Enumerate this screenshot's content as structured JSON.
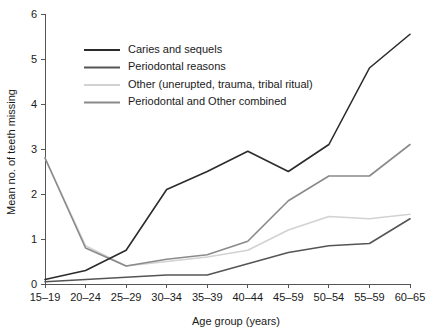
{
  "chart_data": {
    "type": "line",
    "title": "",
    "xlabel": "Age group (years)",
    "ylabel": "Mean no. of teeth missing",
    "categories": [
      "15–19",
      "20–24",
      "25–29",
      "30–34",
      "35–39",
      "40–44",
      "45–59",
      "50–54",
      "55–59",
      "60–65"
    ],
    "ylim": [
      0,
      6
    ],
    "yticks": [
      "0",
      "1",
      "2",
      "3",
      "4",
      "5",
      "6"
    ],
    "grid": false,
    "legend_position": "upper-left-inside",
    "series": [
      {
        "name": "Caries and sequels",
        "color": "#2b2b2b",
        "values": [
          0.1,
          0.3,
          0.75,
          2.1,
          2.5,
          2.95,
          2.5,
          3.1,
          4.8,
          5.55
        ]
      },
      {
        "name": "Periodontal reasons",
        "color": "#555555",
        "values": [
          0.05,
          0.1,
          0.15,
          0.2,
          0.2,
          0.45,
          0.7,
          0.85,
          0.9,
          1.45
        ]
      },
      {
        "name": "Other (unerupted, trauma, tribal ritual)",
        "color": "#d2d2d2",
        "values": [
          2.8,
          0.85,
          0.4,
          0.5,
          0.6,
          0.75,
          1.2,
          1.5,
          1.45,
          1.55
        ]
      },
      {
        "name": "Periodontal and Other combined",
        "color": "#8a8a8a",
        "values": [
          2.8,
          0.8,
          0.4,
          0.55,
          0.65,
          0.95,
          1.85,
          2.4,
          2.4,
          3.1
        ]
      }
    ]
  }
}
